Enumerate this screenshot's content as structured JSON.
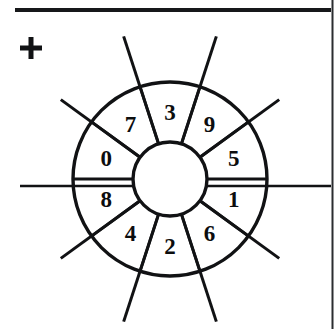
{
  "page": {
    "background_color": "#ffffff",
    "ink_color": "#111214",
    "width": 335,
    "height": 329
  },
  "top_rule": {
    "name": "horizontal-rule",
    "x1": 15,
    "x2": 331,
    "y": 10,
    "thickness": 4,
    "color": "#17181a"
  },
  "right_border": {
    "name": "page-border",
    "x": 332,
    "y1": 0,
    "y2": 329,
    "thickness": 2,
    "color": "#2b2d30"
  },
  "registration_mark": {
    "name": "plus-mark",
    "symbol": "+",
    "center_x": 31,
    "center_y": 48,
    "arm_length": 11,
    "thickness": 5
  },
  "wheel": {
    "title": "numbered-wheel",
    "center_x": 170,
    "center_y": 179,
    "inner_radius": 37,
    "outer_radius": 97,
    "sector_count": 10,
    "sector_span_degrees": 36,
    "outer_stroke_width": 3.4,
    "inner_stroke_width": 3.4,
    "divider_stroke_width": 2.8,
    "spoke_stroke_width": 3.0,
    "sectors": [
      {
        "label": "5",
        "mid_angle": 18
      },
      {
        "label": "9",
        "mid_angle": 54
      },
      {
        "label": "3",
        "mid_angle": 90
      },
      {
        "label": "7",
        "mid_angle": 126
      },
      {
        "label": "0",
        "mid_angle": 162
      },
      {
        "label": "8",
        "mid_angle": 198
      },
      {
        "label": "4",
        "mid_angle": 234
      },
      {
        "label": "2",
        "mid_angle": 270
      },
      {
        "label": "6",
        "mid_angle": 306
      },
      {
        "label": "1",
        "mid_angle": 342
      }
    ],
    "label_radius": 67,
    "divider_angles": [
      0,
      36,
      72,
      108,
      144,
      180,
      216,
      252,
      288,
      324
    ],
    "spokes": [
      {
        "angle": 36,
        "outer_extent": 135
      },
      {
        "angle": 72,
        "outer_extent": 150
      },
      {
        "angle": 108,
        "outer_extent": 150
      },
      {
        "angle": 144,
        "outer_extent": 135
      },
      {
        "angle": 216,
        "outer_extent": 135
      },
      {
        "angle": 252,
        "outer_extent": 150
      },
      {
        "angle": 288,
        "outer_extent": 150
      },
      {
        "angle": 324,
        "outer_extent": 135
      }
    ],
    "axis": {
      "name": "horizontal-axis-line",
      "y": 186,
      "x1": 20,
      "x2": 331,
      "thickness": 2.6
    }
  }
}
